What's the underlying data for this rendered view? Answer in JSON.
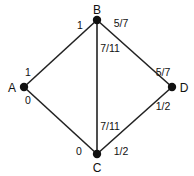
{
  "graph": {
    "colors": {
      "background": "#ffffff",
      "edge": "#222222",
      "node": "#111111",
      "text": "#111111"
    },
    "nodes": [
      {
        "id": "A",
        "label": "A",
        "x": 24,
        "y": 87,
        "label_x": 12,
        "label_y": 92
      },
      {
        "id": "B",
        "label": "B",
        "x": 97,
        "y": 20,
        "label_x": 97,
        "label_y": 14
      },
      {
        "id": "C",
        "label": "C",
        "x": 97,
        "y": 154,
        "label_x": 97,
        "label_y": 172
      },
      {
        "id": "D",
        "label": "D",
        "x": 172,
        "y": 87,
        "label_x": 184,
        "label_y": 92
      }
    ],
    "edges": [
      {
        "id": "AB",
        "from": "A",
        "to": "B",
        "labels": [
          {
            "end": "B",
            "text": "1",
            "x": 80,
            "y": 29
          },
          {
            "end": "A",
            "text": "1",
            "x": 28,
            "y": 76
          }
        ]
      },
      {
        "id": "BD",
        "from": "B",
        "to": "D",
        "labels": [
          {
            "end": "B",
            "text": "5/7",
            "x": 121,
            "y": 27
          },
          {
            "end": "D",
            "text": "5/7",
            "x": 163,
            "y": 76
          }
        ]
      },
      {
        "id": "BC",
        "from": "B",
        "to": "C",
        "labels": [
          {
            "end": "B",
            "text": "7/11",
            "x": 110,
            "y": 52
          },
          {
            "end": "C",
            "text": "7/11",
            "x": 110,
            "y": 130
          }
        ]
      },
      {
        "id": "AC",
        "from": "A",
        "to": "C",
        "labels": [
          {
            "end": "A",
            "text": "0",
            "x": 28,
            "y": 104
          },
          {
            "end": "C",
            "text": "0",
            "x": 79,
            "y": 155
          }
        ]
      },
      {
        "id": "CD",
        "from": "C",
        "to": "D",
        "labels": [
          {
            "end": "C",
            "text": "1/2",
            "x": 121,
            "y": 155
          },
          {
            "end": "D",
            "text": "1/2",
            "x": 163,
            "y": 110
          }
        ]
      }
    ]
  }
}
